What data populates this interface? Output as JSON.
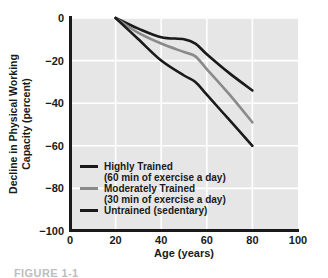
{
  "figure": {
    "caption": "FIGURE 1-1"
  },
  "chart_data": {
    "type": "line",
    "title": "",
    "xlabel": "Age (years)",
    "ylabel": "Decline in Physical Working Capacity (percent)",
    "ylabel_line1": "Decline in Physical Working",
    "ylabel_line2": "Capacity (percent)",
    "xlim": [
      0,
      100
    ],
    "ylim": [
      -100,
      0
    ],
    "xticks": [
      0,
      20,
      40,
      60,
      80,
      100
    ],
    "xtick_labels": [
      "0",
      "20",
      "40",
      "60",
      "80",
      "100"
    ],
    "yticks": [
      0,
      -20,
      -40,
      -60,
      -80,
      -100
    ],
    "ytick_labels": [
      "0",
      "−20",
      "−40",
      "−60",
      "−80",
      "−100"
    ],
    "grid": true,
    "grid_color": "#ffffff",
    "plot_background": "#e6e6e6",
    "axis_color": "#1a1a1a",
    "legend_position": "inside-lower-left",
    "series": [
      {
        "name": "Highly Trained",
        "sublabel": "(60 min of exercise a day)",
        "color": "#1a1a1a",
        "x": [
          20,
          30,
          40,
          50,
          55,
          60,
          70,
          80
        ],
        "values": [
          0,
          -5,
          -9,
          -10,
          -12,
          -17,
          -26,
          -34
        ]
      },
      {
        "name": "Moderately Trained",
        "sublabel": "(30 min of exercise a day)",
        "color": "#8a8a8a",
        "x": [
          20,
          30,
          40,
          50,
          55,
          60,
          70,
          80
        ],
        "values": [
          0,
          -7,
          -12,
          -16,
          -18,
          -24,
          -36,
          -49
        ]
      },
      {
        "name": "Untrained (sedentary)",
        "sublabel": "",
        "color": "#1a1a1a",
        "x": [
          20,
          30,
          40,
          50,
          55,
          60,
          70,
          80
        ],
        "values": [
          0,
          -10,
          -20,
          -27,
          -30,
          -36,
          -48,
          -60
        ]
      }
    ],
    "legend_entries": [
      {
        "label": "Highly Trained",
        "sublabel": "(60 min of exercise a day)",
        "color": "#1a1a1a"
      },
      {
        "label": "Moderately Trained",
        "sublabel": "(30 min of exercise a day)",
        "color": "#8a8a8a"
      },
      {
        "label": "Untrained (sedentary)",
        "sublabel": "",
        "color": "#1a1a1a"
      }
    ]
  }
}
